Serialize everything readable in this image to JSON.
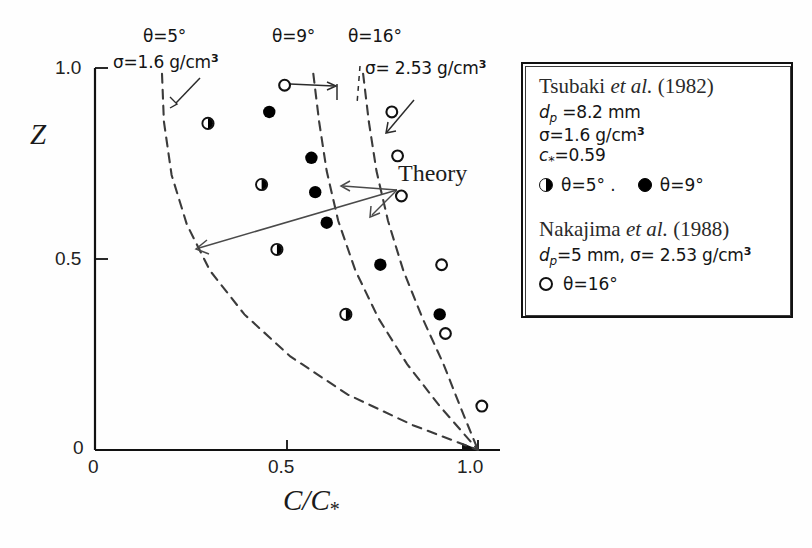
{
  "figure": {
    "kind": "scatter-plot-with-theory-curves"
  },
  "axes": {
    "x_title_main": "C/C",
    "x_title_sub": "*",
    "y_title": "Z",
    "x_ticks": [
      "0",
      "0.5",
      "1.0"
    ],
    "y_ticks": [
      "0",
      "0.5",
      "1.0"
    ]
  },
  "annotations": {
    "theta5_line1": "θ=5°",
    "theta5_line2_pre": "σ=1.6 g/cm",
    "theta5_line2_sup": "3",
    "theta9": "θ=9°",
    "theta16_line1": "θ=16°",
    "theta16_line2_pre": "σ= 2.53 g/cm",
    "theta16_line2_sup": "3",
    "theory": "Theory"
  },
  "legend": {
    "entry1": {
      "title_name": "Tsubaki ",
      "title_italic": "et al.",
      "title_year": " (1982)",
      "dp_sym": "d",
      "dp_sub": "p",
      "dp_val": " =8.2 mm",
      "sigma_pre": "σ=1.6 g/cm",
      "sigma_sup": "3",
      "cstar_sym": "c",
      "cstar_sub": "*",
      "cstar_val": "=0.59",
      "sym_half_label": "θ=5° .",
      "sym_filled_label": "θ=9°"
    },
    "entry2": {
      "title_name": "Nakajima ",
      "title_italic": "et al.",
      "title_year": " (1988)",
      "dp_sym": "d",
      "dp_sub": "p",
      "dp_val": "=5 mm, ",
      "sigma_pre": "σ= 2.53 g/cm",
      "sigma_sup": "3",
      "sym_open_label": "θ=16°"
    }
  },
  "colors": {
    "axis": "#111111",
    "curve": "#3b3b3b",
    "marker_fill": "#000000",
    "marker_open_stroke": "#111111",
    "text": "#151515",
    "background": "#fefefe"
  },
  "chart_data": {
    "type": "scatter",
    "title": "",
    "xlabel": "C/C*",
    "ylabel": "Z",
    "xlim": [
      0,
      1.08
    ],
    "ylim": [
      0,
      1.06
    ],
    "grid": false,
    "legend_position": "right-outside-box",
    "xticks": [
      0,
      0.5,
      1.0
    ],
    "yticks": [
      0,
      0.5,
      1.0
    ],
    "series": [
      {
        "name": "Tsubaki et al. (1982), theta=5 deg",
        "marker": "half-filled-circle",
        "dp_mm": 8.2,
        "sigma_g_cm3": 1.6,
        "c_star": 0.59,
        "points": [
          {
            "x": 0.295,
            "y": 0.855
          },
          {
            "x": 0.435,
            "y": 0.695
          },
          {
            "x": 0.475,
            "y": 0.525
          },
          {
            "x": 0.655,
            "y": 0.355
          }
        ]
      },
      {
        "name": "Tsubaki et al. (1982), theta=9 deg",
        "marker": "filled-circle",
        "dp_mm": 8.2,
        "sigma_g_cm3": 1.6,
        "c_star": 0.59,
        "points": [
          {
            "x": 0.455,
            "y": 0.885
          },
          {
            "x": 0.565,
            "y": 0.765
          },
          {
            "x": 0.575,
            "y": 0.675
          },
          {
            "x": 0.605,
            "y": 0.595
          },
          {
            "x": 0.745,
            "y": 0.485
          },
          {
            "x": 0.9,
            "y": 0.355
          }
        ]
      },
      {
        "name": "Nakajima et al. (1988), theta=16 deg",
        "marker": "open-circle",
        "dp_mm": 5,
        "sigma_g_cm3": 2.53,
        "points": [
          {
            "x": 0.495,
            "y": 0.955
          },
          {
            "x": 0.775,
            "y": 0.885
          },
          {
            "x": 0.79,
            "y": 0.77
          },
          {
            "x": 0.8,
            "y": 0.665
          },
          {
            "x": 0.905,
            "y": 0.485
          },
          {
            "x": 0.915,
            "y": 0.305
          },
          {
            "x": 1.01,
            "y": 0.115
          }
        ]
      }
    ],
    "curves": [
      {
        "name": "Theory theta=5 deg",
        "style": "dashed",
        "points": [
          {
            "x": 0.175,
            "y": 0.985
          },
          {
            "x": 0.18,
            "y": 0.86
          },
          {
            "x": 0.2,
            "y": 0.72
          },
          {
            "x": 0.24,
            "y": 0.59
          },
          {
            "x": 0.3,
            "y": 0.47
          },
          {
            "x": 0.39,
            "y": 0.355
          },
          {
            "x": 0.51,
            "y": 0.245
          },
          {
            "x": 0.66,
            "y": 0.145
          },
          {
            "x": 0.83,
            "y": 0.065
          },
          {
            "x": 1.0,
            "y": 0.0
          }
        ]
      },
      {
        "name": "Theory theta=9 deg",
        "style": "dashed",
        "points": [
          {
            "x": 0.57,
            "y": 0.985
          },
          {
            "x": 0.585,
            "y": 0.86
          },
          {
            "x": 0.605,
            "y": 0.73
          },
          {
            "x": 0.635,
            "y": 0.6
          },
          {
            "x": 0.68,
            "y": 0.47
          },
          {
            "x": 0.74,
            "y": 0.345
          },
          {
            "x": 0.815,
            "y": 0.225
          },
          {
            "x": 0.9,
            "y": 0.115
          },
          {
            "x": 1.0,
            "y": 0.0
          }
        ]
      },
      {
        "name": "Theory theta=16 deg",
        "style": "dashed",
        "points": [
          {
            "x": 0.7,
            "y": 0.985
          },
          {
            "x": 0.715,
            "y": 0.86
          },
          {
            "x": 0.735,
            "y": 0.73
          },
          {
            "x": 0.765,
            "y": 0.6
          },
          {
            "x": 0.805,
            "y": 0.47
          },
          {
            "x": 0.855,
            "y": 0.345
          },
          {
            "x": 0.91,
            "y": 0.225
          },
          {
            "x": 0.955,
            "y": 0.11
          },
          {
            "x": 1.0,
            "y": 0.0
          }
        ]
      }
    ]
  }
}
